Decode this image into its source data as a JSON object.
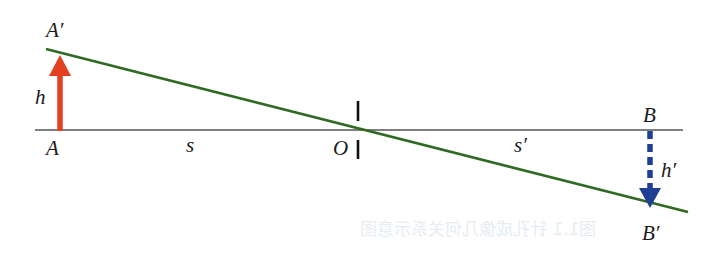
{
  "diagram": {
    "type": "optics-ray-diagram",
    "labels": {
      "object_top": "A′",
      "object_base": "A",
      "object_height": "h",
      "object_distance": "s",
      "lens_center": "O",
      "image_distance": "s′",
      "image_base": "B",
      "image_top": "B′",
      "image_height": "h′"
    },
    "colors": {
      "object_arrow": "#e2401f",
      "image_arrow": "#1f3f95",
      "ray": "#2f6a22",
      "axis": "#555555",
      "lens": "#111111"
    },
    "bleed_through_text": "图1.1  针孔成像几何关系示意图"
  }
}
